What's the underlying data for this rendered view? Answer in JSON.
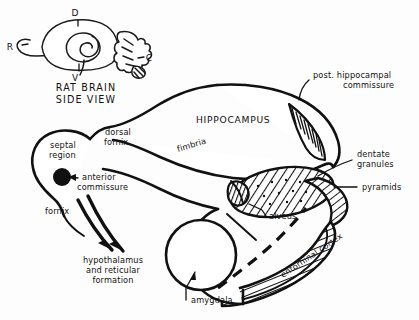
{
  "figure": {
    "background_color": "#fdfdfd",
    "ink_color": "#111111"
  },
  "inset": {
    "name": "rat-brain-side-view",
    "caption_line1": "RAT BRAIN",
    "caption_line2": "SIDE VIEW",
    "orientation_labels": [
      {
        "key": "dorsal",
        "text": "D",
        "x": 75,
        "y": 16
      },
      {
        "key": "ventral",
        "text": "V",
        "x": 75,
        "y": 77
      },
      {
        "key": "rostral",
        "text": "R",
        "x": 12,
        "y": 47
      },
      {
        "key": "caudal",
        "text": "C",
        "x": 143,
        "y": 56
      }
    ]
  },
  "main_labels": [
    {
      "key": "hippocampus",
      "text": "HIPPOCAMPUS",
      "style": "caps",
      "x": 196,
      "y": 123
    },
    {
      "key": "septal-region-line1",
      "text": "septal",
      "style": "plain",
      "x": 50,
      "y": 148
    },
    {
      "key": "septal-region-line2",
      "text": "region",
      "style": "plain",
      "x": 49,
      "y": 158
    },
    {
      "key": "dorsal-fornix-line1",
      "text": "dorsal",
      "style": "plain",
      "x": 105,
      "y": 135
    },
    {
      "key": "dorsal-fornix-line2",
      "text": "fornix",
      "style": "plain",
      "x": 104,
      "y": 145
    },
    {
      "key": "fimbria",
      "text": "fimbria",
      "style": "rotated",
      "x": 178,
      "y": 152,
      "rotation": -17
    },
    {
      "key": "anterior-commissure-line1",
      "text": "anterior",
      "style": "plain",
      "x": 82,
      "y": 180
    },
    {
      "key": "anterior-commissure-line2",
      "text": "commissure",
      "style": "plain",
      "x": 77,
      "y": 190
    },
    {
      "key": "fornix",
      "text": "fornix",
      "style": "plain",
      "x": 45,
      "y": 214
    },
    {
      "key": "hypothalamus-line1",
      "text": "hypothalamus",
      "style": "plain-center",
      "x": 113,
      "y": 263
    },
    {
      "key": "hypothalamus-line2",
      "text": "and reticular",
      "style": "plain-center",
      "x": 113,
      "y": 273
    },
    {
      "key": "hypothalamus-line3",
      "text": "formation",
      "style": "plain-center",
      "x": 113,
      "y": 283
    },
    {
      "key": "amygdala",
      "text": "amygdala",
      "style": "plain",
      "x": 191,
      "y": 303
    },
    {
      "key": "post-hippocampal-commissure-line1",
      "text": "post. hippocampal",
      "style": "plain",
      "x": 313,
      "y": 78
    },
    {
      "key": "post-hippocampal-commissure-line2",
      "text": "commissure",
      "style": "plain",
      "x": 343,
      "y": 88
    },
    {
      "key": "dentate-granules-line1",
      "text": "dentate",
      "style": "plain",
      "x": 357,
      "y": 157
    },
    {
      "key": "dentate-granules-line2",
      "text": "granules",
      "style": "plain",
      "x": 357,
      "y": 167
    },
    {
      "key": "pyramids",
      "text": "pyramids",
      "style": "plain",
      "x": 362,
      "y": 190
    },
    {
      "key": "alveus",
      "text": "alveus",
      "style": "plain",
      "x": 269,
      "y": 219
    },
    {
      "key": "entorhinal-cortex",
      "text": "entorhinal cortex",
      "style": "rotated",
      "x": 283,
      "y": 278,
      "rotation": -34
    }
  ],
  "structures": [
    {
      "key": "hippocampus-body",
      "label": "HIPPOCAMPUS"
    },
    {
      "key": "septal-region",
      "label": "septal region"
    },
    {
      "key": "dorsal-fornix",
      "label": "dorsal fornix"
    },
    {
      "key": "fimbria-band",
      "label": "fimbria"
    },
    {
      "key": "anterior-commissure-dot",
      "label": "anterior commissure"
    },
    {
      "key": "fornix-arrows",
      "label": "fornix"
    },
    {
      "key": "amygdala-circle",
      "label": "amygdala"
    },
    {
      "key": "post-hippocampal-commissure-band",
      "label": "post. hippocampal commissure"
    },
    {
      "key": "dentate-granules-oval",
      "label": "dentate granules"
    },
    {
      "key": "pyramids-band",
      "label": "pyramids"
    },
    {
      "key": "alveus-region",
      "label": "alveus"
    },
    {
      "key": "entorhinal-cortex-band",
      "label": "entorhinal cortex"
    },
    {
      "key": "perforant-path-dashed",
      "label": "perforant path (dashed)"
    }
  ]
}
